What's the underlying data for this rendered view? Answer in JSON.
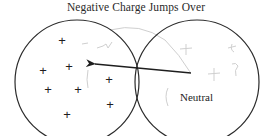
{
  "title": "Negative Charge Jumps Over",
  "left_object": {
    "label": "",
    "charges": [
      {
        "symbol": "+",
        "x": 62,
        "y": 41
      },
      {
        "symbol": "+",
        "x": 69,
        "y": 67
      },
      {
        "symbol": "+",
        "x": 43,
        "y": 71
      },
      {
        "symbol": "+",
        "x": 109,
        "y": 80
      },
      {
        "symbol": "+",
        "x": 48,
        "y": 90
      },
      {
        "symbol": "+",
        "x": 78,
        "y": 90
      },
      {
        "symbol": "+",
        "x": 110,
        "y": 105
      },
      {
        "symbol": "+",
        "x": 67,
        "y": 115
      }
    ]
  },
  "right_object": {
    "label": "Neutral"
  },
  "arrow": {
    "direction": "right-to-left",
    "meaning": "negative charge transfer"
  },
  "colors": {
    "stroke": "#2b2b2b",
    "text": "#222222",
    "pencil": "#c8c8c8"
  }
}
